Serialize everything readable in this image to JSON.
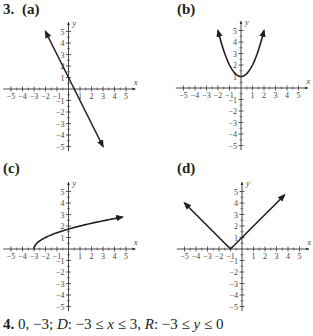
{
  "problem3": {
    "number": "3.",
    "parts": [
      {
        "label": "(a)",
        "function": "y = -2x + 1"
      },
      {
        "label": "(b)",
        "function": "y = x^2 + 1"
      },
      {
        "label": "(c)",
        "function": "y = sqrt(x + 3)"
      },
      {
        "label": "(d)",
        "function": "y = |x + 1|"
      }
    ]
  },
  "axes": {
    "x_label": "x",
    "y_label": "y",
    "ticks": [
      "-5",
      "-4",
      "-3",
      "-2",
      "-1",
      "1",
      "2",
      "3",
      "4",
      "5"
    ]
  },
  "problem4": {
    "number": "4.",
    "intercepts": "0, −3;",
    "domain_label": "D",
    "domain": ": −3 ≤ ",
    "domain_var": "x",
    "domain_end": " ≤ 3, ",
    "range_label": "R",
    "range": ": −3 ≤ ",
    "range_var": "y",
    "range_end": " ≤ 0"
  },
  "chart_data": [
    {
      "type": "line",
      "title": "(a)",
      "xlabel": "x",
      "ylabel": "y",
      "xlim": [
        -5,
        5
      ],
      "ylim": [
        -5,
        5
      ],
      "grid": false,
      "x": [
        -2,
        3
      ],
      "y": [
        5,
        -5
      ],
      "annotations": [
        "arrows at both ends",
        "y-intercept 1"
      ]
    },
    {
      "type": "line",
      "title": "(b)",
      "xlabel": "x",
      "ylabel": "y",
      "xlim": [
        -5,
        5
      ],
      "ylim": [
        -5,
        5
      ],
      "grid": false,
      "x": [
        -2,
        -1.5,
        -1,
        -0.5,
        0,
        0.5,
        1,
        1.5,
        2
      ],
      "y": [
        5,
        3.25,
        2,
        1.25,
        1,
        1.25,
        2,
        3.25,
        5
      ],
      "annotations": [
        "arrows at both ends",
        "vertex (0,1)"
      ]
    },
    {
      "type": "line",
      "title": "(c)",
      "xlabel": "x",
      "ylabel": "y",
      "xlim": [
        -5,
        5
      ],
      "ylim": [
        -5,
        5
      ],
      "grid": false,
      "x": [
        -3,
        -2.5,
        -2,
        -1,
        0,
        1,
        2,
        3,
        4,
        4.7
      ],
      "y": [
        0,
        0.71,
        1,
        1.41,
        1.73,
        2,
        2.24,
        2.45,
        2.65,
        2.77
      ],
      "annotations": [
        "starts at (-3,0)",
        "arrow at right end"
      ]
    },
    {
      "type": "line",
      "title": "(d)",
      "xlabel": "x",
      "ylabel": "y",
      "xlim": [
        -5,
        5
      ],
      "ylim": [
        -5,
        5
      ],
      "grid": false,
      "x": [
        -5,
        -1,
        3.7
      ],
      "y": [
        4,
        0,
        4.7
      ],
      "annotations": [
        "vertex (-1,0)",
        "arrows at both ends"
      ]
    }
  ]
}
